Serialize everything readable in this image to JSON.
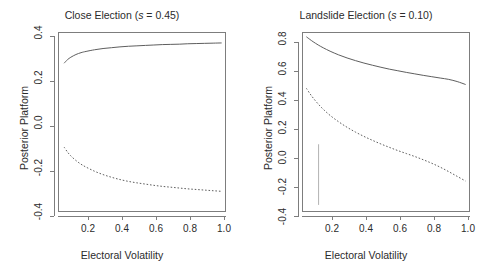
{
  "figure": {
    "background": "#ffffff",
    "line_color": "#5c5c5c",
    "axis_color": "#7d7d7d"
  },
  "chart_data": [
    {
      "type": "line",
      "title": "Close Election (s = 0.45)",
      "title_prefix": "Close Election (",
      "title_symbol": "s",
      "title_suffix": " = 0.45)",
      "xlabel": "Electoral Volatility",
      "ylabel": "Posterior Platform",
      "xlim": [
        0.04,
        1.02
      ],
      "ylim": [
        -0.44,
        0.42
      ],
      "grid": false,
      "legend": "none",
      "xticks": [
        0.2,
        0.4,
        0.6,
        0.8,
        1.0
      ],
      "xtick_labels": [
        "0.2",
        "0.4",
        "0.6",
        "0.8",
        "1.0"
      ],
      "yticks": [
        0.4,
        0.2,
        0.0,
        -0.2,
        -0.4
      ],
      "ytick_labels": [
        "0.4",
        "0.2",
        "0.0",
        "-0.2",
        "-0.4"
      ],
      "series": [
        {
          "name": "upper-solid",
          "style": "solid",
          "x": [
            0.07,
            0.09,
            0.11,
            0.14,
            0.17,
            0.2,
            0.25,
            0.3,
            0.35,
            0.4,
            0.45,
            0.5,
            0.55,
            0.6,
            0.65,
            0.7,
            0.75,
            0.8,
            0.85,
            0.9,
            0.95,
            1.0
          ],
          "y": [
            0.274,
            0.291,
            0.303,
            0.316,
            0.325,
            0.331,
            0.339,
            0.345,
            0.349,
            0.353,
            0.356,
            0.358,
            0.36,
            0.362,
            0.364,
            0.365,
            0.366,
            0.368,
            0.369,
            0.37,
            0.371,
            0.372
          ]
        },
        {
          "name": "lower-dashed",
          "style": "dashed",
          "x": [
            0.07,
            0.09,
            0.11,
            0.14,
            0.17,
            0.2,
            0.25,
            0.3,
            0.35,
            0.4,
            0.45,
            0.5,
            0.55,
            0.6,
            0.65,
            0.7,
            0.75,
            0.8,
            0.85,
            0.9,
            0.95,
            1.0
          ],
          "y": [
            -0.131,
            -0.155,
            -0.174,
            -0.196,
            -0.214,
            -0.228,
            -0.248,
            -0.264,
            -0.277,
            -0.288,
            -0.297,
            -0.304,
            -0.31,
            -0.316,
            -0.321,
            -0.325,
            -0.329,
            -0.333,
            -0.336,
            -0.339,
            -0.342,
            -0.345
          ]
        }
      ]
    },
    {
      "type": "line",
      "title": "Landslide Election (s = 0.10)",
      "title_prefix": "Landslide Election (",
      "title_symbol": "s",
      "title_suffix": " = 0.10)",
      "xlabel": "Electoral Volatility",
      "ylabel": "Posterior Platform",
      "xlim": [
        0.04,
        1.02
      ],
      "ylim": [
        -0.44,
        0.88
      ],
      "grid": false,
      "legend": "none",
      "xticks": [
        0.2,
        0.4,
        0.6,
        0.8,
        1.0
      ],
      "xtick_labels": [
        "0.2",
        "0.4",
        "0.6",
        "0.8",
        "1.0"
      ],
      "yticks": [
        0.8,
        0.6,
        0.4,
        0.2,
        0.0,
        -0.2,
        -0.4
      ],
      "ytick_labels": [
        "0.8",
        "0.6",
        "0.4",
        "0.2",
        "0.0",
        "-0.2",
        "-0.4"
      ],
      "series": [
        {
          "name": "upper-solid",
          "style": "solid",
          "x": [
            0.06,
            0.08,
            0.1,
            0.13,
            0.16,
            0.2,
            0.25,
            0.3,
            0.35,
            0.4,
            0.45,
            0.5,
            0.55,
            0.6,
            0.65,
            0.7,
            0.75,
            0.8,
            0.85,
            0.9,
            0.95,
            1.0
          ],
          "y": [
            0.852,
            0.833,
            0.815,
            0.791,
            0.77,
            0.745,
            0.718,
            0.695,
            0.675,
            0.657,
            0.641,
            0.626,
            0.612,
            0.6,
            0.588,
            0.577,
            0.566,
            0.556,
            0.546,
            0.536,
            0.52,
            0.498
          ]
        },
        {
          "name": "lower-dashed",
          "style": "dashed",
          "x": [
            0.06,
            0.08,
            0.1,
            0.13,
            0.16,
            0.2,
            0.25,
            0.3,
            0.35,
            0.4,
            0.45,
            0.5,
            0.55,
            0.6,
            0.65,
            0.7,
            0.75,
            0.8,
            0.85,
            0.9,
            0.95,
            1.0
          ],
          "y": [
            0.47,
            0.432,
            0.398,
            0.353,
            0.314,
            0.269,
            0.222,
            0.181,
            0.145,
            0.113,
            0.084,
            0.057,
            0.032,
            0.008,
            -0.014,
            -0.036,
            -0.06,
            -0.086,
            -0.115,
            -0.148,
            -0.183,
            -0.218
          ]
        }
      ],
      "artifact": {
        "name": "vertical-streak",
        "x": 0.132,
        "y_top": 0.055,
        "y_bottom": -0.395
      }
    }
  ]
}
